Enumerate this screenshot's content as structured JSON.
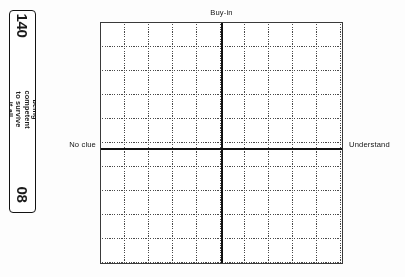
{
  "page": {
    "folio": "140",
    "running_head": "being competent to survive it all",
    "chapter_marker": "08"
  },
  "figure": {
    "axis_labels": {
      "top": "Buy-in",
      "left": "No clue",
      "right": "Understand"
    }
  },
  "chart_data": {
    "type": "scatter",
    "title": "",
    "subtitle": "",
    "xlabel": "",
    "ylabel": "",
    "grid": true,
    "legend": null,
    "axis_style": "quadrant-cross",
    "gridlines": {
      "vertical_count": 10,
      "horizontal_count": 10,
      "style": "dotted"
    },
    "quadrant_axes": {
      "x_axis": {
        "left_label": "No clue",
        "right_label": "Understand",
        "position": "center"
      },
      "y_axis": {
        "top_label": "Buy-in",
        "bottom_label": "",
        "position": "center"
      }
    },
    "x": [],
    "y": [],
    "series": [],
    "annotations": [],
    "note": "Blank quadrant worksheet grid: no plotted data points are printed on the page."
  }
}
